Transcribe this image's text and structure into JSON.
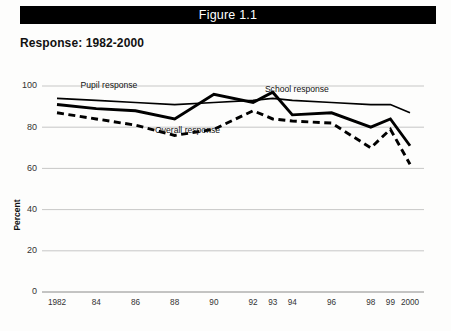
{
  "figure": {
    "title": "Figure 1.1",
    "subtitle": "Response: 1982-2000"
  },
  "chart_data": {
    "type": "line",
    "title": "Response: 1982-2000",
    "xlabel": "",
    "ylabel": "Percent",
    "ylim": [
      0,
      100
    ],
    "yticks": [
      0,
      20,
      40,
      60,
      80,
      100
    ],
    "grid": true,
    "legend_position": "inline-annotations",
    "categories": [
      "1982",
      "84",
      "86",
      "88",
      "90",
      "92",
      "93",
      "94",
      "96",
      "98",
      "99",
      "2000"
    ],
    "x": [
      1982,
      1984,
      1986,
      1988,
      1990,
      1992,
      1993,
      1994,
      1996,
      1998,
      1999,
      2000
    ],
    "series": [
      {
        "name": "Pupil response",
        "style": "thin-solid",
        "color": "#000000",
        "values": [
          94,
          93,
          92,
          91,
          92,
          93,
          94,
          93,
          92,
          91,
          91,
          87
        ]
      },
      {
        "name": "School response",
        "style": "thick-solid",
        "color": "#000000",
        "values": [
          91,
          89,
          88,
          84,
          96,
          92,
          97,
          86,
          87,
          80,
          84,
          71
        ]
      },
      {
        "name": "Overall response",
        "style": "thick-dashed",
        "color": "#000000",
        "values": [
          87,
          84,
          81,
          76,
          79,
          88,
          84,
          83,
          82,
          70,
          79,
          62
        ]
      }
    ],
    "annotations": [
      {
        "text": "Pupil response",
        "x": 1983.2,
        "y": 99
      },
      {
        "text": "School response",
        "x": 1992.6,
        "y": 97
      },
      {
        "text": "Overall response",
        "x": 1987.0,
        "y": 77
      }
    ]
  }
}
